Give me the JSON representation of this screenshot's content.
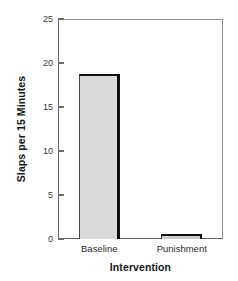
{
  "chart_data": {
    "type": "bar",
    "title": "",
    "categories": [
      "Baseline",
      "Punishment"
    ],
    "values": [
      18.7,
      0.6
    ],
    "xlabel": "Intervention",
    "ylabel": "Slaps per 15 Minutes",
    "ylim": [
      0,
      25
    ],
    "yticks": [
      0,
      5,
      10,
      15,
      20,
      25
    ],
    "ytick_labels": [
      "0",
      "5",
      "10",
      "15",
      "20",
      "25"
    ],
    "xtick_labels": [
      "Baseline",
      "Punishment"
    ],
    "grid": false,
    "legend": false,
    "bar_fill_color": "#d9d9d9",
    "bar_edge_color": "#111111",
    "axis_color": "#5f5f5f",
    "background_color": "#ffffff"
  }
}
